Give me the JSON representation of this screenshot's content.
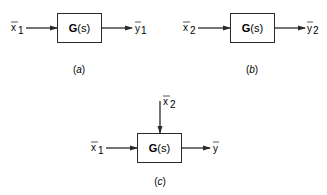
{
  "diagram": {
    "panels": [
      {
        "id": "a",
        "caption": "(a)",
        "caption_letter": "a",
        "block": {
          "name": "G",
          "arg": "(s)"
        },
        "inputs": [
          {
            "symbol": "x",
            "subscript": "1",
            "side": "left"
          }
        ],
        "output": {
          "symbol": "y",
          "subscript": "1"
        }
      },
      {
        "id": "b",
        "caption": "(b)",
        "caption_letter": "b",
        "block": {
          "name": "G",
          "arg": "(s)"
        },
        "inputs": [
          {
            "symbol": "x",
            "subscript": "2",
            "side": "left"
          }
        ],
        "output": {
          "symbol": "y",
          "subscript": "2"
        }
      },
      {
        "id": "c",
        "caption": "(c)",
        "caption_letter": "c",
        "block": {
          "name": "G",
          "arg": "(s)"
        },
        "inputs": [
          {
            "symbol": "x",
            "subscript": "1",
            "side": "left"
          },
          {
            "symbol": "x",
            "subscript": "2",
            "side": "top"
          }
        ],
        "output": {
          "symbol": "y",
          "subscript": ""
        }
      }
    ],
    "colors": {
      "stroke": "#2a2a2a",
      "text": "#1a1a1a",
      "background": "#ffffff"
    }
  }
}
